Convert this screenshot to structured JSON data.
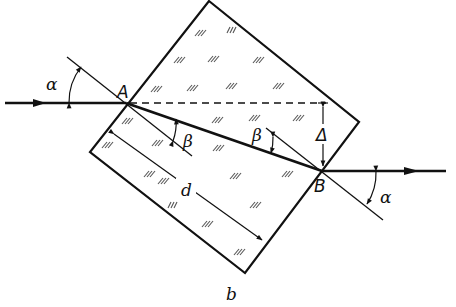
{
  "figure": {
    "caption": "b"
  },
  "labels": {
    "point_a": "A",
    "point_b": "B",
    "incidence_angle_left": "α",
    "incidence_angle_right": "α",
    "refraction_angle_left": "β",
    "refraction_angle_right": "β",
    "displacement": "Δ",
    "thickness": "d"
  },
  "colors": {
    "line": "#111111",
    "background": "#ffffff",
    "hatch": "#555555"
  }
}
